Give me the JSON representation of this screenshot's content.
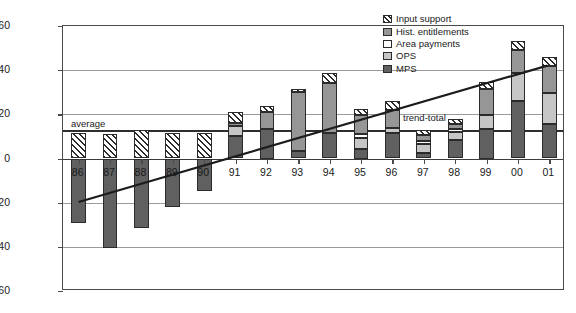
{
  "chart_data": {
    "type": "bar",
    "title": "",
    "subtitle": "",
    "xlabel": "",
    "ylabel": "Protection (percent)",
    "ylim": [
      -60,
      60
    ],
    "ytick_step": 20,
    "yticks": [
      "60",
      "40",
      "20",
      "0",
      "-20",
      "-40",
      "-60"
    ],
    "grid": true,
    "stacked": true,
    "legend_position": "top-right",
    "categories": [
      "86",
      "87",
      "88",
      "89",
      "90",
      "91",
      "92",
      "93",
      "94",
      "95",
      "96",
      "97",
      "98",
      "99",
      "00",
      "01"
    ],
    "series": [
      {
        "name": "MPS",
        "color": "#606060",
        "values": [
          -29.0,
          -40.5,
          -31.5,
          -22.0,
          -14.5,
          10.0,
          13.5,
          3.5,
          11.5,
          4.5,
          11.5,
          2.5,
          8.5,
          13.5,
          26.0,
          15.5
        ]
      },
      {
        "name": "OPS",
        "color": "#c6c6c6",
        "values": [
          0.0,
          0.0,
          0.0,
          0.0,
          0.0,
          4.5,
          0.0,
          0.0,
          0.0,
          5.0,
          2.5,
          4.0,
          3.5,
          6.0,
          12.5,
          14.0
        ]
      },
      {
        "name": "Area payments",
        "color": "#ffffff",
        "values": [
          0.0,
          0.0,
          0.0,
          0.0,
          0.0,
          0.0,
          0.0,
          0.0,
          0.0,
          1.5,
          0.0,
          1.5,
          1.5,
          0.0,
          0.0,
          0.0
        ]
      },
      {
        "name": "Hist. entitlements",
        "color": "#969696",
        "values": [
          0.0,
          0.0,
          0.0,
          0.0,
          0.0,
          1.5,
          7.5,
          26.5,
          22.5,
          8.5,
          8.0,
          2.5,
          2.0,
          12.0,
          10.5,
          12.5
        ]
      },
      {
        "name": "Input support",
        "color": "#hatch",
        "values": [
          11.5,
          11.0,
          13.0,
          11.5,
          11.5,
          5.0,
          3.0,
          1.5,
          4.5,
          3.0,
          4.0,
          2.5,
          2.5,
          3.0,
          4.0,
          4.0
        ]
      }
    ],
    "annotations": [
      {
        "name": "average-line",
        "label": "average",
        "type": "hline",
        "value": 13.0
      },
      {
        "name": "trend-total-line",
        "label": "trend-total",
        "type": "trend",
        "start_value": -20.0,
        "end_value": 42.0
      }
    ]
  },
  "legend": {
    "items": [
      {
        "label": "Input support",
        "swatch": "hatched-swatch"
      },
      {
        "label": "Hist. entitlements",
        "swatch": "mid-gray-swatch"
      },
      {
        "label": "Area payments",
        "swatch": "white-swatch"
      },
      {
        "label": "OPS",
        "swatch": "light-gray-swatch"
      },
      {
        "label": "MPS",
        "swatch": "dark-gray-swatch"
      }
    ]
  }
}
